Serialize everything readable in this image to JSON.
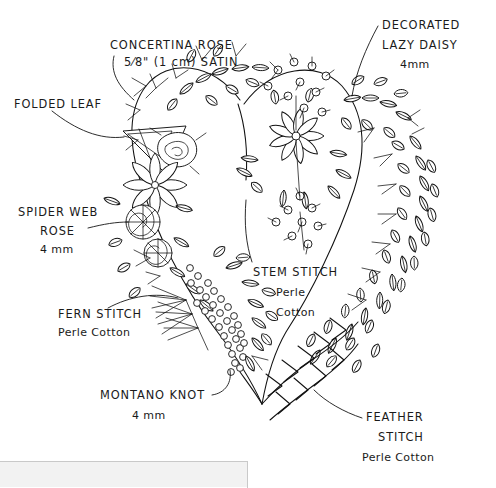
{
  "document": {
    "kind": "embroidery-pattern-diagram",
    "subject": "Heart-shaped floral wreath stitch guide",
    "background_color": "#ffffff",
    "ink_color": "#111111"
  },
  "annotations": [
    {
      "id": "concertina-rose",
      "lines": [
        "CONCERTINA ROSE",
        "5⁄8\" (1 cm) SATIN"
      ],
      "x": 110,
      "y": 40,
      "align": "start"
    },
    {
      "id": "folded-leaf",
      "lines": [
        "FOLDED LEAF"
      ],
      "x": 14,
      "y": 101,
      "align": "start"
    },
    {
      "id": "spider-web-rose",
      "lines": [
        "SPIDER WEB",
        "ROSE",
        "4 mm"
      ],
      "x": 18,
      "y": 209,
      "align": "start"
    },
    {
      "id": "fern-stitch",
      "lines": [
        "FERN STITCH",
        "Perle Cotton"
      ],
      "x": 58,
      "y": 311,
      "align": "start"
    },
    {
      "id": "montano-knot",
      "lines": [
        "MONTANO KNOT",
        "4 mm"
      ],
      "x": 100,
      "y": 392,
      "align": "start"
    },
    {
      "id": "stem-stitch",
      "lines": [
        "STEM STITCH",
        "Perle",
        "Cotton"
      ],
      "x": 253,
      "y": 269,
      "align": "start"
    },
    {
      "id": "decorated-lazy-daisy",
      "lines": [
        "DECORATED",
        "LAZY DAISY",
        "4mm"
      ],
      "x": 382,
      "y": 22,
      "align": "start"
    },
    {
      "id": "feather-stitch",
      "lines": [
        "FEATHER",
        "STITCH",
        "Perle Cotton"
      ],
      "x": 366,
      "y": 414,
      "align": "start"
    }
  ],
  "label_text": {
    "concertina_rose_1": "CONCERTINA ROSE",
    "concertina_rose_2": "5⁄8\" (1 cm) SATIN",
    "folded_leaf_1": "FOLDED LEAF",
    "spider_web_rose_1": "SPIDER WEB",
    "spider_web_rose_2": "ROSE",
    "spider_web_rose_3": "4 mm",
    "fern_stitch_1": "FERN STITCH",
    "fern_stitch_2": "Perle Cotton",
    "montano_knot_1": "MONTANO KNOT",
    "montano_knot_2": "4 mm",
    "stem_stitch_1": "STEM STITCH",
    "stem_stitch_2": "Perle",
    "stem_stitch_3": "Cotton",
    "lazy_daisy_1": "DECORATED",
    "lazy_daisy_2": "LAZY DAISY",
    "lazy_daisy_3": "4mm",
    "feather_stitch_1": "FEATHER",
    "feather_stitch_2": "STITCH",
    "feather_stitch_3": "Perle Cotton"
  },
  "ui_panel": {
    "present": true,
    "fill": "#f2f2f2",
    "border": "#c9c9c9"
  }
}
